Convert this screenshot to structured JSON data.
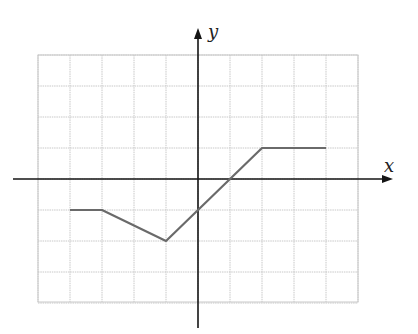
{
  "chart_data": {
    "type": "line",
    "title": "",
    "xlabel": "x",
    "ylabel": "y",
    "xlim": [
      -5,
      5
    ],
    "ylim": [
      -4,
      4
    ],
    "grid": true,
    "legend": null,
    "tick_labels": false,
    "series": [
      {
        "name": "f(x)",
        "x": [
          -4,
          -3,
          -1,
          0,
          1,
          2,
          4
        ],
        "y": [
          -1,
          -1,
          -2,
          -1,
          0,
          1,
          1
        ]
      }
    ]
  },
  "axes": {
    "x_label": "x",
    "y_label": "y"
  },
  "colors": {
    "curve": "#6a6a6a",
    "axis": "#151515",
    "grid": "#c8c8c8",
    "background": "#ffffff"
  },
  "layout_px": {
    "origin": [
      198,
      179
    ],
    "unit_x": 32,
    "unit_y": 31,
    "grid_left": 38,
    "grid_right": 358,
    "grid_top": 55,
    "grid_bottom": 302,
    "x_axis_from": 13,
    "x_axis_to": 393,
    "y_axis_from": 328,
    "y_axis_to": 28
  }
}
